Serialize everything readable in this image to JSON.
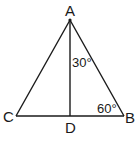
{
  "figure": {
    "type": "triangle",
    "vertices": {
      "A": {
        "label": "A",
        "x": 70,
        "y": 20
      },
      "B": {
        "label": "B",
        "x": 124,
        "y": 116
      },
      "C": {
        "label": "C",
        "x": 16,
        "y": 116
      },
      "D": {
        "label": "D",
        "x": 70,
        "y": 116
      }
    },
    "segments": [
      "AB",
      "AC",
      "CB",
      "AD"
    ],
    "angles": [
      {
        "at": "A",
        "between": "DAB",
        "label": "30°"
      },
      {
        "at": "B",
        "between": "ABD",
        "label": "60°"
      }
    ],
    "stroke_color": "#1a1a1a"
  }
}
